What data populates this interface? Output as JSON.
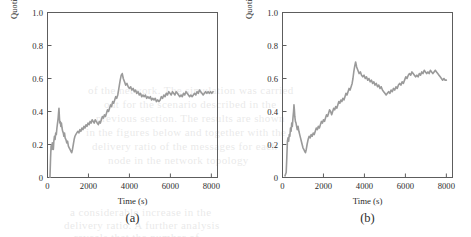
{
  "page": {
    "background_color": "#ffffff",
    "ink_color": "#2b2b2b",
    "bleed_through_lines": [
      {
        "text": "of the network. The simulation was carried",
        "x": 88,
        "y": 84
      },
      {
        "text": "out for the scenario described in the",
        "x": 104,
        "y": 98
      },
      {
        "text": "previous section. The results are shown",
        "x": 96,
        "y": 112
      },
      {
        "text": "in the figures below and together with the",
        "x": 86,
        "y": 126
      },
      {
        "text": "delivery ratio of the messages for each",
        "x": 92,
        "y": 140
      },
      {
        "text": "node in the network topology",
        "x": 108,
        "y": 154
      },
      {
        "text": "a considerable increase in the",
        "x": 70,
        "y": 206
      },
      {
        "text": "delivery ratio. A further analysis",
        "x": 64,
        "y": 219
      },
      {
        "text": "reveals that the number of",
        "x": 74,
        "y": 231
      }
    ]
  },
  "figures": [
    {
      "id": "a",
      "caption": "(a)",
      "ylabel": "Quotient of delivered and formed messages",
      "xlabel": "Time (s)",
      "yticks": [
        "0",
        "0.2",
        "0.4",
        "0.6",
        "0.8",
        "1.0"
      ],
      "xticks": [
        "0",
        "2000",
        "4000",
        "6000",
        "8000"
      ]
    },
    {
      "id": "b",
      "caption": "(b)",
      "ylabel": "Quotient of delivered and formed messages",
      "xlabel": "Time (s)",
      "yticks": [
        "0",
        "0.2",
        "0.4",
        "0.6",
        "0.8",
        "1.0"
      ],
      "xticks": [
        "0",
        "2000",
        "4000",
        "6000",
        "8000"
      ]
    }
  ],
  "chart_data": [
    {
      "type": "line",
      "id": "a",
      "title": "(a)",
      "xlabel": "Time (s)",
      "ylabel": "Quotient of delivered and formed messages",
      "xlim": [
        0,
        8300
      ],
      "ylim": [
        0,
        1.0
      ],
      "xticks": [
        0,
        2000,
        4000,
        6000,
        8000
      ],
      "yticks": [
        0,
        0.2,
        0.4,
        0.6,
        0.8,
        1.0
      ],
      "grid": false,
      "legend": null,
      "line_color": "#9a9a9a",
      "line_width": 1.6,
      "series": [
        {
          "name": "Quotient of delivered and formed messages",
          "x": [
            120,
            150,
            175,
            200,
            215,
            235,
            260,
            285,
            310,
            340,
            370,
            400,
            430,
            460,
            490,
            520,
            545,
            560,
            580,
            600,
            625,
            650,
            680,
            710,
            740,
            770,
            800,
            830,
            860,
            900,
            940,
            980,
            1020,
            1060,
            1100,
            1140,
            1180,
            1220,
            1260,
            1300,
            1340,
            1380,
            1430,
            1480,
            1530,
            1580,
            1630,
            1680,
            1730,
            1780,
            1830,
            1880,
            1930,
            1980,
            2030,
            2080,
            2130,
            2180,
            2230,
            2280,
            2330,
            2380,
            2430,
            2480,
            2530,
            2580,
            2630,
            2680,
            2730,
            2780,
            2830,
            2880,
            2930,
            2980,
            3030,
            3080,
            3130,
            3180,
            3230,
            3280,
            3330,
            3380,
            3430,
            3470,
            3510,
            3550,
            3600,
            3650,
            3700,
            3760,
            3820,
            3880,
            3940,
            4000,
            4060,
            4120,
            4180,
            4240,
            4300,
            4360,
            4420,
            4480,
            4540,
            4600,
            4660,
            4720,
            4780,
            4840,
            4900,
            4960,
            5020,
            5080,
            5140,
            5200,
            5260,
            5320,
            5380,
            5440,
            5500,
            5560,
            5620,
            5680,
            5740,
            5800,
            5860,
            5920,
            5980,
            6040,
            6100,
            6160,
            6220,
            6280,
            6340,
            6400,
            6460,
            6520,
            6580,
            6640,
            6700,
            6760,
            6820,
            6880,
            6940,
            7000,
            7060,
            7120,
            7180,
            7240,
            7300,
            7360,
            7420,
            7480,
            7540,
            7600,
            7660,
            7720,
            7780,
            7840,
            7900,
            7960,
            8020,
            8080,
            8140,
            8200
          ],
          "y": [
            0.0,
            0.12,
            0.19,
            0.2,
            0.17,
            0.21,
            0.2,
            0.17,
            0.22,
            0.25,
            0.23,
            0.27,
            0.26,
            0.3,
            0.33,
            0.36,
            0.4,
            0.42,
            0.37,
            0.33,
            0.34,
            0.31,
            0.33,
            0.3,
            0.28,
            0.27,
            0.25,
            0.27,
            0.24,
            0.23,
            0.21,
            0.22,
            0.19,
            0.18,
            0.17,
            0.16,
            0.15,
            0.17,
            0.2,
            0.23,
            0.25,
            0.26,
            0.27,
            0.28,
            0.27,
            0.29,
            0.28,
            0.3,
            0.29,
            0.31,
            0.3,
            0.32,
            0.31,
            0.33,
            0.32,
            0.34,
            0.33,
            0.35,
            0.34,
            0.33,
            0.35,
            0.34,
            0.33,
            0.32,
            0.34,
            0.33,
            0.35,
            0.37,
            0.36,
            0.38,
            0.37,
            0.39,
            0.41,
            0.4,
            0.42,
            0.44,
            0.43,
            0.46,
            0.45,
            0.47,
            0.49,
            0.48,
            0.5,
            0.53,
            0.56,
            0.59,
            0.62,
            0.63,
            0.6,
            0.58,
            0.56,
            0.57,
            0.55,
            0.54,
            0.55,
            0.53,
            0.54,
            0.52,
            0.53,
            0.51,
            0.52,
            0.5,
            0.51,
            0.49,
            0.5,
            0.49,
            0.5,
            0.48,
            0.49,
            0.48,
            0.49,
            0.47,
            0.48,
            0.47,
            0.48,
            0.46,
            0.47,
            0.46,
            0.47,
            0.49,
            0.48,
            0.5,
            0.49,
            0.51,
            0.5,
            0.52,
            0.51,
            0.5,
            0.52,
            0.51,
            0.5,
            0.52,
            0.51,
            0.5,
            0.49,
            0.5,
            0.49,
            0.51,
            0.5,
            0.52,
            0.51,
            0.5,
            0.49,
            0.5,
            0.49,
            0.5,
            0.51,
            0.5,
            0.52,
            0.51,
            0.53,
            0.52,
            0.51,
            0.5,
            0.51,
            0.52,
            0.51,
            0.52,
            0.51,
            0.52,
            0.51,
            0.52
          ]
        }
      ]
    },
    {
      "type": "line",
      "id": "b",
      "title": "(b)",
      "xlabel": "Time (s)",
      "ylabel": "Quotient of delivered and formed messages",
      "xlim": [
        0,
        8300
      ],
      "ylim": [
        0,
        1.0
      ],
      "xticks": [
        0,
        2000,
        4000,
        6000,
        8000
      ],
      "yticks": [
        0,
        0.2,
        0.4,
        0.6,
        0.8,
        1.0
      ],
      "grid": false,
      "legend": null,
      "line_color": "#9a9a9a",
      "line_width": 1.6,
      "series": [
        {
          "name": "Quotient of delivered and formed messages",
          "x": [
            120,
            150,
            180,
            210,
            240,
            270,
            300,
            330,
            360,
            390,
            420,
            450,
            480,
            510,
            540,
            560,
            580,
            600,
            630,
            660,
            690,
            720,
            760,
            800,
            840,
            880,
            920,
            960,
            1000,
            1040,
            1080,
            1120,
            1160,
            1200,
            1250,
            1300,
            1350,
            1400,
            1450,
            1500,
            1550,
            1600,
            1650,
            1700,
            1750,
            1800,
            1850,
            1900,
            1950,
            2000,
            2050,
            2100,
            2150,
            2200,
            2250,
            2300,
            2350,
            2400,
            2450,
            2500,
            2550,
            2600,
            2650,
            2700,
            2750,
            2800,
            2850,
            2900,
            2950,
            3000,
            3050,
            3100,
            3150,
            3200,
            3250,
            3300,
            3350,
            3400,
            3440,
            3480,
            3520,
            3570,
            3620,
            3680,
            3740,
            3800,
            3860,
            3920,
            3980,
            4040,
            4100,
            4160,
            4220,
            4280,
            4340,
            4400,
            4460,
            4520,
            4580,
            4640,
            4700,
            4760,
            4820,
            4880,
            4940,
            5000,
            5060,
            5120,
            5180,
            5240,
            5300,
            5360,
            5420,
            5480,
            5540,
            5600,
            5660,
            5720,
            5780,
            5840,
            5900,
            5960,
            6020,
            6080,
            6140,
            6200,
            6260,
            6320,
            6380,
            6440,
            6500,
            6560,
            6620,
            6680,
            6740,
            6800,
            6860,
            6920,
            6980,
            7040,
            7100,
            7160,
            7220,
            7280,
            7340,
            7400,
            7460,
            7520,
            7580,
            7640,
            7700,
            7760,
            7820,
            7880,
            7940,
            8000,
            8060,
            8120,
            8180,
            8230
          ],
          "y": [
            0.01,
            0.02,
            0.03,
            0.12,
            0.22,
            0.24,
            0.22,
            0.26,
            0.25,
            0.3,
            0.28,
            0.33,
            0.31,
            0.36,
            0.4,
            0.44,
            0.41,
            0.37,
            0.34,
            0.33,
            0.31,
            0.29,
            0.31,
            0.28,
            0.26,
            0.24,
            0.22,
            0.2,
            0.18,
            0.17,
            0.16,
            0.15,
            0.17,
            0.2,
            0.23,
            0.25,
            0.24,
            0.26,
            0.25,
            0.27,
            0.26,
            0.28,
            0.3,
            0.29,
            0.31,
            0.3,
            0.32,
            0.34,
            0.33,
            0.35,
            0.34,
            0.36,
            0.38,
            0.37,
            0.39,
            0.41,
            0.4,
            0.38,
            0.4,
            0.42,
            0.41,
            0.43,
            0.42,
            0.44,
            0.46,
            0.45,
            0.47,
            0.46,
            0.48,
            0.47,
            0.49,
            0.51,
            0.5,
            0.52,
            0.54,
            0.53,
            0.55,
            0.57,
            0.6,
            0.64,
            0.67,
            0.7,
            0.67,
            0.65,
            0.63,
            0.64,
            0.62,
            0.61,
            0.62,
            0.6,
            0.61,
            0.59,
            0.6,
            0.58,
            0.59,
            0.57,
            0.58,
            0.56,
            0.57,
            0.55,
            0.56,
            0.54,
            0.55,
            0.53,
            0.52,
            0.51,
            0.5,
            0.51,
            0.52,
            0.51,
            0.53,
            0.52,
            0.54,
            0.53,
            0.55,
            0.54,
            0.56,
            0.57,
            0.56,
            0.58,
            0.57,
            0.59,
            0.61,
            0.6,
            0.62,
            0.63,
            0.62,
            0.64,
            0.63,
            0.62,
            0.61,
            0.62,
            0.61,
            0.63,
            0.62,
            0.64,
            0.63,
            0.65,
            0.64,
            0.63,
            0.64,
            0.63,
            0.65,
            0.64,
            0.63,
            0.64,
            0.65,
            0.64,
            0.63,
            0.62,
            0.61,
            0.6,
            0.59,
            0.6,
            0.59,
            0.59
          ]
        }
      ]
    }
  ]
}
